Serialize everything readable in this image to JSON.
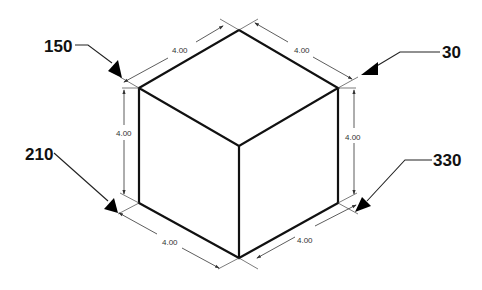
{
  "diagram": {
    "cube_edge_length": "4.00",
    "dimensions": {
      "top_left": "4.00",
      "top_right": "4.00",
      "left_vertical": "4.00",
      "right_vertical": "4.00",
      "bottom_left": "4.00",
      "bottom_right": "4.00"
    },
    "angle_labels": {
      "upper_left": "150",
      "upper_right": "30",
      "lower_left": "210",
      "lower_right": "330"
    },
    "colors": {
      "background": "#ffffff",
      "lines": "#111111",
      "dimension_lines": "#333333"
    }
  }
}
